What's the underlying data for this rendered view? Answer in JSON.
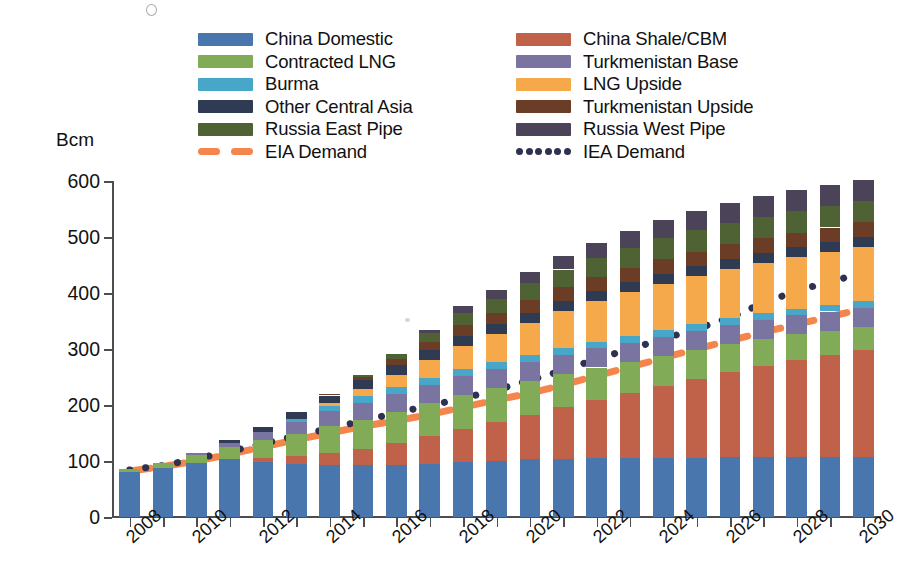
{
  "chart_data": {
    "type": "bar",
    "stacked": true,
    "title": "",
    "xlabel": "",
    "ylabel": "Bcm",
    "ylim": [
      0,
      600
    ],
    "ytick_step": 100,
    "yticks": [
      "0",
      "100",
      "200",
      "300",
      "400",
      "500",
      "600"
    ],
    "grid": false,
    "legend_position": "top",
    "categories": [
      "2008",
      "2009",
      "2010",
      "2011",
      "2012",
      "2013",
      "2014",
      "2015",
      "2016",
      "2017",
      "2018",
      "2019",
      "2020",
      "2021",
      "2022",
      "2023",
      "2024",
      "2025",
      "2026",
      "2027",
      "2028",
      "2029",
      "2030"
    ],
    "xtick_labels_shown": [
      "2008",
      "2010",
      "2012",
      "2014",
      "2016",
      "2018",
      "2020",
      "2022",
      "2024",
      "2026",
      "2028",
      "2030"
    ],
    "series": [
      {
        "name": "China Domestic",
        "color": "#4A76AE",
        "values": [
          80,
          88,
          96,
          103,
          98,
          95,
          93,
          92,
          92,
          95,
          98,
          100,
          103,
          104,
          105,
          105,
          106,
          106,
          107,
          107,
          107,
          107,
          108
        ]
      },
      {
        "name": "China Shale/CBM",
        "color": "#C0624A",
        "values": [
          0,
          0,
          0,
          0,
          8,
          14,
          22,
          30,
          40,
          50,
          60,
          70,
          80,
          92,
          104,
          116,
          128,
          140,
          152,
          163,
          173,
          182,
          190
        ]
      },
      {
        "name": "Contracted LNG",
        "color": "#82AB58",
        "values": [
          5,
          8,
          14,
          22,
          32,
          40,
          48,
          52,
          56,
          58,
          60,
          60,
          60,
          60,
          58,
          56,
          54,
          52,
          50,
          48,
          46,
          44,
          42
        ]
      },
      {
        "name": "Turkmenistan Base",
        "color": "#7A74A0",
        "values": [
          0,
          0,
          4,
          8,
          14,
          20,
          26,
          30,
          32,
          33,
          34,
          34,
          34,
          34,
          34,
          34,
          34,
          34,
          34,
          34,
          34,
          34,
          34
        ]
      },
      {
        "name": "Burma",
        "color": "#48A6C8",
        "values": [
          0,
          0,
          0,
          0,
          0,
          6,
          10,
          12,
          12,
          12,
          12,
          12,
          12,
          12,
          12,
          12,
          12,
          12,
          12,
          12,
          12,
          12,
          12
        ]
      },
      {
        "name": "LNG Upside",
        "color": "#F6A94A",
        "values": [
          0,
          0,
          0,
          0,
          0,
          0,
          4,
          12,
          22,
          32,
          42,
          50,
          58,
          66,
          72,
          78,
          82,
          86,
          88,
          90,
          92,
          94,
          96
        ]
      },
      {
        "name": "Other Central Asia",
        "color": "#2E3B52",
        "values": [
          0,
          0,
          0,
          4,
          8,
          12,
          14,
          16,
          18,
          18,
          18,
          18,
          18,
          18,
          18,
          18,
          18,
          18,
          18,
          18,
          18,
          18,
          18
        ]
      },
      {
        "name": "Turkmenistan Upside",
        "color": "#6B3D26",
        "values": [
          0,
          0,
          0,
          0,
          0,
          0,
          2,
          6,
          10,
          14,
          18,
          20,
          22,
          24,
          25,
          26,
          26,
          26,
          26,
          26,
          26,
          26,
          26
        ]
      },
      {
        "name": "Russia East Pipe",
        "color": "#4E6233",
        "values": [
          0,
          0,
          0,
          0,
          0,
          0,
          0,
          4,
          10,
          16,
          22,
          26,
          30,
          32,
          34,
          36,
          38,
          38,
          38,
          38,
          38,
          38,
          38
        ]
      },
      {
        "name": "Russia West Pipe",
        "color": "#4B4458",
        "values": [
          0,
          0,
          0,
          0,
          0,
          0,
          0,
          0,
          0,
          6,
          12,
          16,
          20,
          24,
          28,
          30,
          32,
          34,
          36,
          38,
          38,
          38,
          38
        ]
      }
    ],
    "lines": [
      {
        "name": "EIA Demand",
        "color": "#F4854B",
        "style": "dashed",
        "x": [
          "2008",
          "2009",
          "2010",
          "2011",
          "2012",
          "2013",
          "2014",
          "2015",
          "2016",
          "2017",
          "2018",
          "2019",
          "2020",
          "2021",
          "2022",
          "2023",
          "2024",
          "2025",
          "2026",
          "2027",
          "2028",
          "2029",
          "2030"
        ],
        "values": [
          82,
          90,
          100,
          112,
          125,
          138,
          150,
          162,
          172,
          183,
          196,
          209,
          221,
          236,
          252,
          268,
          284,
          300,
          315,
          330,
          344,
          358,
          372
        ]
      },
      {
        "name": "IEA Demand",
        "color": "#2E3250",
        "style": "dotted",
        "x": [
          "2008",
          "2009",
          "2010",
          "2011",
          "2012",
          "2013",
          "2014",
          "2015",
          "2016",
          "2017",
          "2018",
          "2019",
          "2020",
          "2021",
          "2022",
          "2023",
          "2024",
          "2025",
          "2026",
          "2027",
          "2028",
          "2029",
          "2030"
        ],
        "values": [
          84,
          92,
          104,
          117,
          131,
          145,
          158,
          172,
          186,
          199,
          212,
          227,
          244,
          262,
          282,
          300,
          318,
          336,
          356,
          382,
          404,
          420,
          436
        ]
      }
    ]
  },
  "legend": {
    "left_column": [
      {
        "label": "China Domestic",
        "color": "#4A76AE",
        "key": "swatch"
      },
      {
        "label": "Contracted LNG",
        "color": "#82AB58",
        "key": "swatch"
      },
      {
        "label": "Burma",
        "color": "#48A6C8",
        "key": "swatch"
      },
      {
        "label": "Other Central Asia",
        "color": "#2E3B52",
        "key": "swatch"
      },
      {
        "label": "Russia East Pipe",
        "color": "#4E6233",
        "key": "swatch"
      },
      {
        "label": "EIA Demand",
        "color": "#F4854B",
        "key": "dashed-line"
      }
    ],
    "right_column": [
      {
        "label": "China Shale/CBM",
        "color": "#C0624A",
        "key": "swatch"
      },
      {
        "label": "Turkmenistan Base",
        "color": "#7A74A0",
        "key": "swatch"
      },
      {
        "label": "LNG Upside",
        "color": "#F6A94A",
        "key": "swatch"
      },
      {
        "label": "Turkmenistan Upside",
        "color": "#6B3D26",
        "key": "swatch"
      },
      {
        "label": "Russia West Pipe",
        "color": "#4B4458",
        "key": "swatch"
      },
      {
        "label": "IEA Demand",
        "color": "#2E3250",
        "key": "dotted-line"
      }
    ]
  },
  "axis": {
    "y_unit_label": "Bcm"
  }
}
